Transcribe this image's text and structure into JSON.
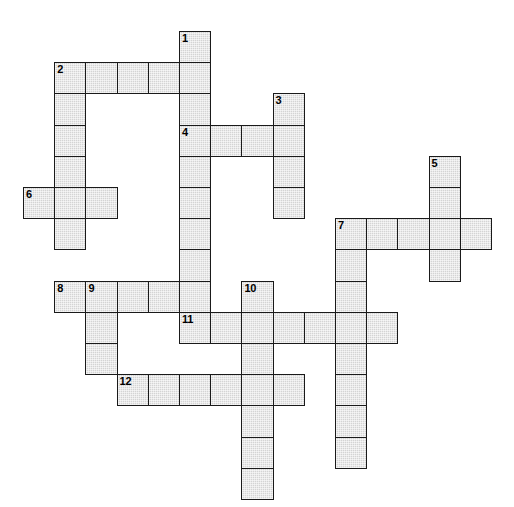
{
  "puzzle": {
    "title": "Crossword Puzzle Grid",
    "type": "crossword-grid",
    "grid": {
      "cell_size": 31.2,
      "origin_x": 23,
      "origin_y": 31,
      "columns": 16,
      "rows": 15,
      "cell_fill": "#d4d4d4",
      "cell_border": "#1a1a1a",
      "background": "#ffffff",
      "number_color": "#000000"
    },
    "entries": [
      {
        "number": "1",
        "direction": "down",
        "row": 0,
        "col": 5,
        "length": 9
      },
      {
        "number": "2",
        "direction": "across",
        "row": 1,
        "col": 1,
        "length": 5
      },
      {
        "number": "2",
        "direction": "down",
        "row": 1,
        "col": 1,
        "length": 6
      },
      {
        "number": "3",
        "direction": "down",
        "row": 2,
        "col": 8,
        "length": 4
      },
      {
        "number": "4",
        "direction": "across",
        "row": 3,
        "col": 5,
        "length": 4
      },
      {
        "number": "5",
        "direction": "down",
        "row": 4,
        "col": 13,
        "length": 4
      },
      {
        "number": "6",
        "direction": "across",
        "row": 5,
        "col": 0,
        "length": 3
      },
      {
        "number": "7",
        "direction": "across",
        "row": 6,
        "col": 10,
        "length": 5
      },
      {
        "number": "7",
        "direction": "down",
        "row": 6,
        "col": 10,
        "length": 8
      },
      {
        "number": "8",
        "direction": "across",
        "row": 8,
        "col": 1,
        "length": 5
      },
      {
        "number": "9",
        "direction": "down",
        "row": 8,
        "col": 2,
        "length": 3
      },
      {
        "number": "10",
        "direction": "down",
        "row": 8,
        "col": 7,
        "length": 7
      },
      {
        "number": "11",
        "direction": "across",
        "row": 9,
        "col": 5,
        "length": 7
      },
      {
        "number": "12",
        "direction": "across",
        "row": 11,
        "col": 3,
        "length": 6
      }
    ],
    "cells": [
      {
        "row": 0,
        "col": 5,
        "number": "1"
      },
      {
        "row": 1,
        "col": 1,
        "number": "2"
      },
      {
        "row": 1,
        "col": 2,
        "number": ""
      },
      {
        "row": 1,
        "col": 3,
        "number": ""
      },
      {
        "row": 1,
        "col": 4,
        "number": ""
      },
      {
        "row": 1,
        "col": 5,
        "number": ""
      },
      {
        "row": 2,
        "col": 1,
        "number": ""
      },
      {
        "row": 2,
        "col": 5,
        "number": ""
      },
      {
        "row": 2,
        "col": 8,
        "number": "3"
      },
      {
        "row": 3,
        "col": 1,
        "number": ""
      },
      {
        "row": 3,
        "col": 5,
        "number": "4"
      },
      {
        "row": 3,
        "col": 6,
        "number": ""
      },
      {
        "row": 3,
        "col": 7,
        "number": ""
      },
      {
        "row": 3,
        "col": 8,
        "number": ""
      },
      {
        "row": 4,
        "col": 1,
        "number": ""
      },
      {
        "row": 4,
        "col": 5,
        "number": ""
      },
      {
        "row": 4,
        "col": 8,
        "number": ""
      },
      {
        "row": 4,
        "col": 13,
        "number": "5"
      },
      {
        "row": 5,
        "col": 0,
        "number": "6"
      },
      {
        "row": 5,
        "col": 1,
        "number": ""
      },
      {
        "row": 5,
        "col": 2,
        "number": ""
      },
      {
        "row": 5,
        "col": 5,
        "number": ""
      },
      {
        "row": 5,
        "col": 8,
        "number": ""
      },
      {
        "row": 5,
        "col": 13,
        "number": ""
      },
      {
        "row": 6,
        "col": 1,
        "number": ""
      },
      {
        "row": 6,
        "col": 5,
        "number": ""
      },
      {
        "row": 6,
        "col": 10,
        "number": "7"
      },
      {
        "row": 6,
        "col": 11,
        "number": ""
      },
      {
        "row": 6,
        "col": 12,
        "number": ""
      },
      {
        "row": 6,
        "col": 13,
        "number": ""
      },
      {
        "row": 6,
        "col": 14,
        "number": ""
      },
      {
        "row": 7,
        "col": 5,
        "number": ""
      },
      {
        "row": 7,
        "col": 10,
        "number": ""
      },
      {
        "row": 7,
        "col": 13,
        "number": ""
      },
      {
        "row": 8,
        "col": 1,
        "number": "8"
      },
      {
        "row": 8,
        "col": 2,
        "number": "9"
      },
      {
        "row": 8,
        "col": 3,
        "number": ""
      },
      {
        "row": 8,
        "col": 4,
        "number": ""
      },
      {
        "row": 8,
        "col": 5,
        "number": ""
      },
      {
        "row": 8,
        "col": 7,
        "number": "10"
      },
      {
        "row": 8,
        "col": 10,
        "number": ""
      },
      {
        "row": 9,
        "col": 2,
        "number": ""
      },
      {
        "row": 9,
        "col": 5,
        "number": "11"
      },
      {
        "row": 9,
        "col": 6,
        "number": ""
      },
      {
        "row": 9,
        "col": 7,
        "number": ""
      },
      {
        "row": 9,
        "col": 8,
        "number": ""
      },
      {
        "row": 9,
        "col": 9,
        "number": ""
      },
      {
        "row": 9,
        "col": 10,
        "number": ""
      },
      {
        "row": 9,
        "col": 11,
        "number": ""
      },
      {
        "row": 10,
        "col": 2,
        "number": ""
      },
      {
        "row": 10,
        "col": 7,
        "number": ""
      },
      {
        "row": 10,
        "col": 10,
        "number": ""
      },
      {
        "row": 11,
        "col": 3,
        "number": "12"
      },
      {
        "row": 11,
        "col": 4,
        "number": ""
      },
      {
        "row": 11,
        "col": 5,
        "number": ""
      },
      {
        "row": 11,
        "col": 6,
        "number": ""
      },
      {
        "row": 11,
        "col": 7,
        "number": ""
      },
      {
        "row": 11,
        "col": 8,
        "number": ""
      },
      {
        "row": 11,
        "col": 10,
        "number": ""
      },
      {
        "row": 12,
        "col": 7,
        "number": ""
      },
      {
        "row": 12,
        "col": 10,
        "number": ""
      },
      {
        "row": 13,
        "col": 7,
        "number": ""
      },
      {
        "row": 13,
        "col": 10,
        "number": ""
      },
      {
        "row": 14,
        "col": 7,
        "number": ""
      }
    ]
  }
}
